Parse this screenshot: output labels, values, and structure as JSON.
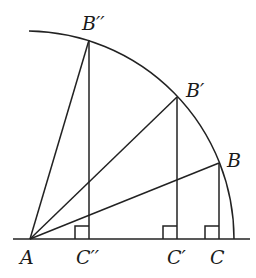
{
  "diagram": {
    "colors": {
      "stroke": "#222222",
      "text": "#1a1a1a",
      "background": "#ffffff"
    },
    "center": {
      "label": "A",
      "x": 30,
      "y": 239
    },
    "radius": 204,
    "baseline": {
      "x1": 13,
      "x2": 250,
      "y": 239
    },
    "arc": {
      "start": {
        "x": 29,
        "y": 30
      },
      "end": {
        "x": 234,
        "y": 239
      }
    },
    "points": [
      {
        "label": "B",
        "x": 219,
        "y": 163,
        "foot_label": "C",
        "foot_x": 219
      },
      {
        "label": "B′",
        "x": 177,
        "y": 97,
        "foot_label": "C′",
        "foot_x": 177
      },
      {
        "label": "B′′",
        "x": 89,
        "y": 40,
        "foot_label": "C′′",
        "foot_x": 89
      }
    ],
    "labels": {
      "A": "A",
      "B": "B",
      "B_prime": "B′",
      "B_double_prime": "B′′",
      "C": "C",
      "C_prime": "C′",
      "C_double_prime": "C′′"
    }
  }
}
